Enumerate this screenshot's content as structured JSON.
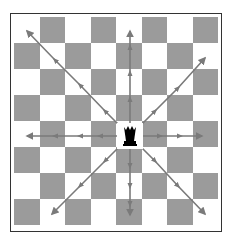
{
  "diagram": {
    "board": {
      "rows": 8,
      "cols": 8,
      "top_left_color": "light",
      "light_color": "#ffffff",
      "dark_color": "#9b9b9b"
    },
    "piece": {
      "name": "queen",
      "color": "black",
      "row": 4,
      "col": 4
    },
    "arrow_color": "#7a7a7a",
    "directions": [
      "north",
      "south",
      "east",
      "west",
      "north-east",
      "north-west",
      "south-east",
      "south-west"
    ]
  }
}
